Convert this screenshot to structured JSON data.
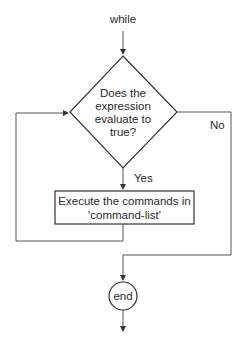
{
  "diagram": {
    "type": "flowchart",
    "title": "while",
    "nodes": {
      "start": {
        "label": "while"
      },
      "decision": {
        "lines": [
          "Does the",
          "expression",
          "evaluate to",
          "true?"
        ]
      },
      "process": {
        "lines": [
          "Execute the commands in",
          "'command-list'"
        ]
      },
      "end": {
        "label": "end"
      }
    },
    "edges": {
      "yes_label": "Yes",
      "no_label": "No"
    },
    "colors": {
      "stroke": "#333333",
      "edge": "#555555",
      "text": "#2a2a2a",
      "background": "#ffffff"
    }
  }
}
